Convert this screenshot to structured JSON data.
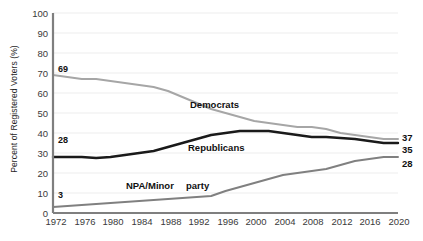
{
  "chart_data": {
    "type": "line",
    "title": "",
    "xlabel": "",
    "ylabel": "Percent of Registered Voters (%)",
    "xlim": [
      1972,
      2020
    ],
    "ylim": [
      0,
      100
    ],
    "grid": true,
    "legend": "inline-labels",
    "x": [
      1972,
      1974,
      1976,
      1978,
      1980,
      1982,
      1984,
      1986,
      1988,
      1990,
      1992,
      1994,
      1996,
      1998,
      2000,
      2002,
      2004,
      2006,
      2008,
      2010,
      2012,
      2014,
      2016,
      2018,
      2020
    ],
    "yticks": [
      0,
      10,
      20,
      30,
      40,
      50,
      60,
      70,
      80,
      90,
      100
    ],
    "xticks": [
      1972,
      1976,
      1980,
      1984,
      1988,
      1992,
      1996,
      2000,
      2004,
      2008,
      2012,
      2016,
      2020
    ],
    "series": [
      {
        "name": "Democrats",
        "color": "#a6a6a6",
        "inline_label": "Democrats",
        "start_label": "69",
        "end_label": "37",
        "values": [
          69,
          68,
          67,
          67,
          66,
          65,
          64,
          63,
          61,
          58,
          55,
          52,
          50,
          48,
          46,
          45,
          44,
          43,
          43,
          42,
          40,
          39,
          38,
          37,
          37
        ]
      },
      {
        "name": "Republicans",
        "color": "#1a1a1a",
        "inline_label": "Republicans",
        "start_label": "28",
        "end_label": "35",
        "values": [
          28,
          28,
          28,
          27.5,
          28,
          29,
          30,
          31,
          33,
          35,
          37,
          39,
          40,
          41,
          41,
          41,
          40,
          39,
          38,
          38,
          37.5,
          37,
          36,
          35,
          35
        ]
      },
      {
        "name": "NPA/Minor party",
        "color": "#808080",
        "inline_label": "NPA/Minor    party",
        "start_label": "3",
        "end_label": "28",
        "values": [
          3,
          3.5,
          4,
          4.5,
          5,
          5.5,
          6,
          6.5,
          7,
          7.5,
          8,
          8.5,
          11,
          13,
          15,
          17,
          19,
          20,
          21,
          22,
          24,
          26,
          27,
          28,
          28
        ]
      }
    ]
  },
  "labels": {
    "democrats_inline": "Democrats",
    "republicans_inline": "Republicans",
    "npa_inline_a": "NPA/Minor",
    "npa_inline_b": "party"
  }
}
